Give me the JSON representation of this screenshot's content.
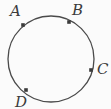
{
  "figure": {
    "kind": "circle-with-labeled-points",
    "background_color": "#fbfbfb",
    "stroke_color": "#4a4a4a",
    "marker_color": "#3b3b3b",
    "label_color": "#3b3b3b",
    "circle": {
      "center_x": 51,
      "center_y": 59,
      "radius": 43,
      "stroke_width": 1.3
    },
    "points": [
      {
        "id": "A",
        "label": "A",
        "marker_x": 23,
        "marker_y": 25,
        "angle_deg": 141
      },
      {
        "id": "B",
        "label": "B",
        "marker_x": 69,
        "marker_y": 22,
        "angle_deg": 54
      },
      {
        "id": "C",
        "label": "C",
        "marker_x": 91,
        "marker_y": 70,
        "angle_deg": -15
      },
      {
        "id": "D",
        "label": "D",
        "marker_x": 26,
        "marker_y": 90,
        "angle_deg": -142
      }
    ],
    "notes": {
      "d_label_clipped": "bottom of D letter is cut off by image edge"
    }
  }
}
